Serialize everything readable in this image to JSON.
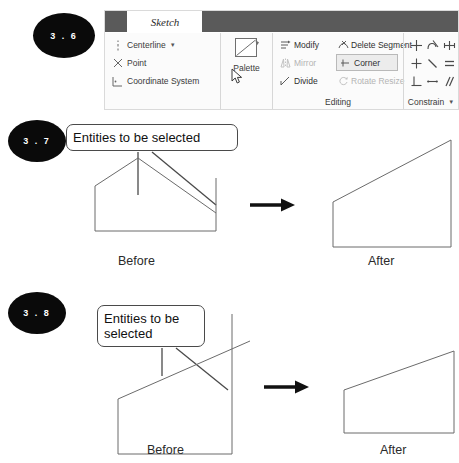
{
  "figures": [
    {
      "id": "3.6",
      "badge": "3 . 6"
    },
    {
      "id": "3.7",
      "badge": "3 . 7"
    },
    {
      "id": "3.8",
      "badge": "3 . 8"
    }
  ],
  "ribbon": {
    "tab_label": "Sketch",
    "groups": {
      "sketch_entities": {
        "items": [
          {
            "label": "Centerline",
            "icon": "centerline-icon",
            "has_dropdown": true
          },
          {
            "label": "Point",
            "icon": "point-icon",
            "has_dropdown": false
          },
          {
            "label": "Coordinate System",
            "icon": "coordinate-system-icon",
            "has_dropdown": false
          }
        ]
      },
      "palette": {
        "label": "Palette",
        "icon": "palette-icon"
      },
      "editing": {
        "label": "Editing",
        "items": [
          {
            "label": "Modify",
            "icon": "modify-icon",
            "state": "enabled",
            "highlighted": false
          },
          {
            "label": "Delete Segment",
            "icon": "delete-segment-icon",
            "state": "enabled",
            "highlighted": false
          },
          {
            "label": "Mirror",
            "icon": "mirror-icon",
            "state": "disabled",
            "highlighted": false
          },
          {
            "label": "Corner",
            "icon": "corner-icon",
            "state": "enabled",
            "highlighted": true
          },
          {
            "label": "Divide",
            "icon": "divide-icon",
            "state": "enabled",
            "highlighted": false
          },
          {
            "label": "Rotate Resize",
            "icon": "rotate-resize-icon",
            "state": "disabled",
            "highlighted": false
          }
        ]
      },
      "constrain": {
        "label": "Constrain",
        "has_dropdown": true,
        "icons": [
          "coincident-constraint-icon",
          "tangent-constraint-icon",
          "symmetric-constraint-icon",
          "midpoint-constraint-icon",
          "collinear-constraint-icon",
          "equal-constraint-icon",
          "perpendicular-constraint-icon",
          "horizontal-constraint-icon",
          "parallel-constraint-icon"
        ]
      }
    },
    "cursor": "mouse-pointer-icon"
  },
  "figure_3_7": {
    "callout_text": "Entities to be selected",
    "before_label": "Before",
    "after_label": "After",
    "arrow": "right-arrow-icon"
  },
  "figure_3_8": {
    "callout_text": "Entities to be selected",
    "before_label": "Before",
    "after_label": "After",
    "arrow": "right-arrow-icon"
  },
  "colors": {
    "badge_fill": "#0a0a0a",
    "badge_text": "#ffffff",
    "ribbon_bg": "#fbfbfb",
    "ribbon_topbar_block": "#5a5a5a",
    "sketch_line": "#6b6b6b",
    "callout_border": "#4a4a4a",
    "highlight_bg": "#ececec",
    "disabled_text": "#b4b4b4"
  }
}
